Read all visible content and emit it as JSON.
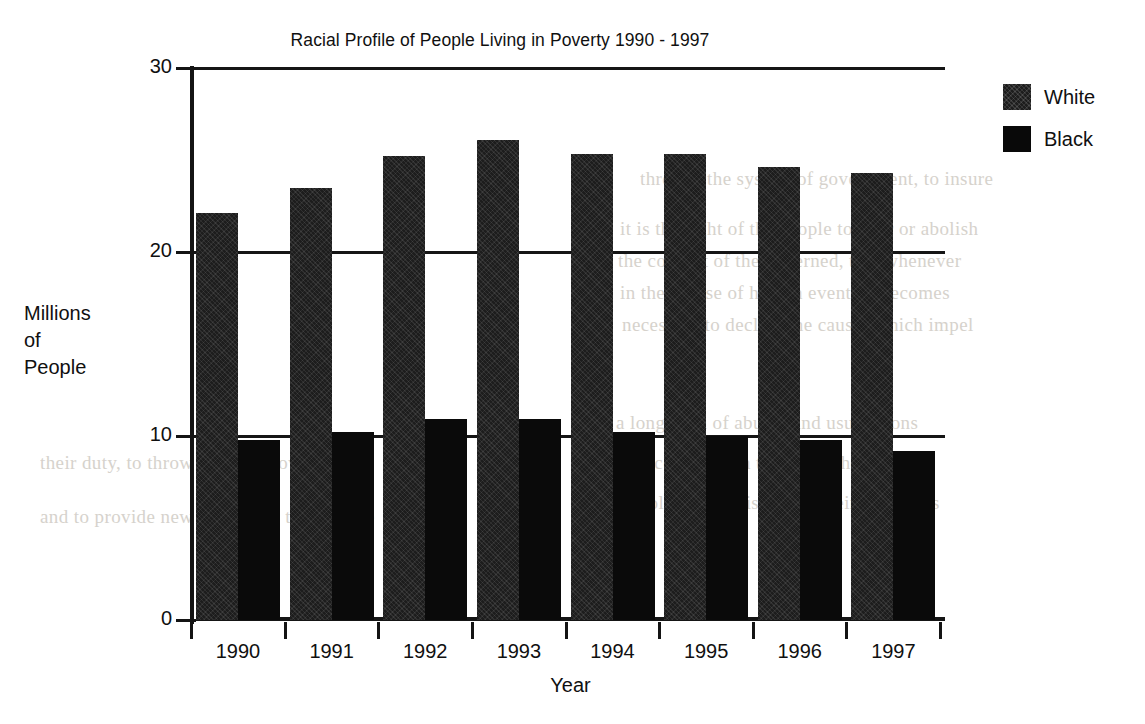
{
  "chart_data": {
    "type": "bar",
    "title": "Racial Profile of People Living in Poverty 1990 - 1997",
    "xlabel": "Year",
    "ylabel": "Millions of People",
    "ylabel_lines": [
      "Millions",
      "of",
      "People"
    ],
    "categories": [
      "1990",
      "1991",
      "1992",
      "1993",
      "1994",
      "1995",
      "1996",
      "1997"
    ],
    "series": [
      {
        "name": "White",
        "values": [
          22.1,
          23.5,
          25.2,
          26.1,
          25.3,
          25.3,
          24.6,
          24.3
        ]
      },
      {
        "name": "Black",
        "values": [
          9.8,
          10.2,
          10.9,
          10.9,
          10.2,
          10.0,
          9.8,
          9.2
        ]
      }
    ],
    "ylim": [
      0,
      30
    ],
    "yticks": [
      0,
      10,
      20,
      30
    ],
    "ytick_labels": [
      "0",
      "10",
      "20",
      "30"
    ],
    "grid": true,
    "grid_axis": "y",
    "legend_position": "top-right",
    "colors": {
      "white_series": "#1d1d1d",
      "black_series": "#0a0a0a",
      "axis": "#141414",
      "text": "#101010"
    }
  },
  "legend": {
    "entries": [
      {
        "label": "White"
      },
      {
        "label": "Black"
      }
    ]
  },
  "background_bleed": {
    "lines": [
      "through the system of government, to insure",
      "it is the right of the people to alter or abolish",
      "the consent of the governed, that whenever",
      "in the course of human events it becomes",
      "necessary to declare the causes which impel",
      "a long train of abuses and usurpations",
      "evinces a design to reduce them under",
      "absolute despotism, it is their right, it is",
      "their duty, to throw off such government",
      "and to provide new guards for their future"
    ]
  }
}
